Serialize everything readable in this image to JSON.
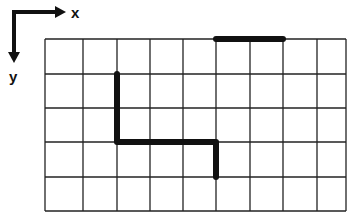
{
  "axes": {
    "x_label": "x",
    "y_label": "y"
  },
  "grid": {
    "columns": 9,
    "rows": 5,
    "col_lines_px": [
      45,
      83,
      117,
      150,
      183,
      216,
      250,
      283,
      317,
      346
    ],
    "row_lines_px": [
      39,
      74,
      108,
      142,
      177,
      211
    ],
    "line_color": "#222222"
  },
  "paths": [
    {
      "name": "top-segment",
      "grid_points": [
        [
          5,
          0
        ],
        [
          7,
          0
        ]
      ],
      "color": "#111111"
    },
    {
      "name": "stepped-path",
      "grid_points": [
        [
          2,
          1
        ],
        [
          2,
          3
        ],
        [
          5,
          3
        ],
        [
          5,
          4
        ]
      ],
      "color": "#111111"
    }
  ]
}
